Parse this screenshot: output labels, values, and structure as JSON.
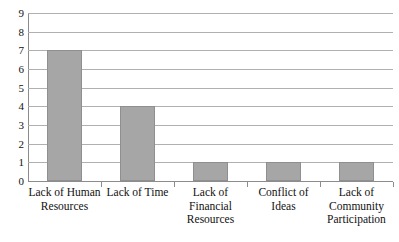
{
  "chart_data": {
    "type": "bar",
    "title": "",
    "subtitle": "",
    "xlabel": "",
    "ylabel": "",
    "categories": [
      "Lack of Human Resources",
      "Lack of Time",
      "Lack of Financial Resources",
      "Conflict of Ideas",
      "Lack of Community Participation"
    ],
    "values": [
      7,
      4,
      1,
      1,
      1
    ],
    "ylim": [
      0,
      9
    ],
    "y_ticks": [
      0,
      1,
      2,
      3,
      4,
      5,
      6,
      7,
      8,
      9
    ],
    "y_tick_labels": [
      "0",
      "1",
      "2",
      "3",
      "4",
      "5",
      "6",
      "7",
      "8",
      "9"
    ],
    "grid": true,
    "legend": false,
    "legend_position": "none",
    "series": [
      {
        "name": "",
        "values": [
          7,
          4,
          1,
          1,
          1
        ],
        "color": "#a6a6a6",
        "border_color": "#8f8f8f"
      }
    ],
    "category_label_lines": [
      [
        "Lack of Human",
        "Resources"
      ],
      [
        "Lack of Time"
      ],
      [
        "Lack of",
        "Financial",
        "Resources"
      ],
      [
        "Conflict of",
        "Ideas"
      ],
      [
        "Lack of",
        "Community",
        "Participation"
      ]
    ]
  },
  "colors": {
    "background": "#ffffff",
    "bar_fill": "#a6a6a6",
    "bar_border": "#8f8f8f",
    "gridline": "#b0b0b0",
    "axis": "#8c8c8c",
    "text": "#111111"
  }
}
